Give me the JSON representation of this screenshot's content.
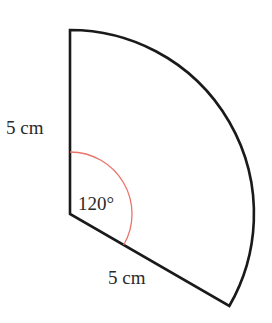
{
  "figure": {
    "type": "sector",
    "center": [
      70,
      214
    ],
    "radius_px": 184,
    "angle_deg": 120,
    "colors": {
      "outline": "#1a1a1a",
      "angle_arc": "#e8736a",
      "text": "#2a2a2a"
    },
    "labels": {
      "left_radius": "5 cm",
      "bottom_radius": "5 cm",
      "angle": "120°"
    }
  }
}
